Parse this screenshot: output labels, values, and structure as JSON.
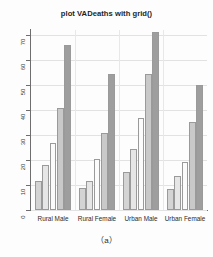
{
  "figure": {
    "title": "plot VADeaths with grid()",
    "caption": "（a）"
  },
  "axes": {
    "y_ticks": [
      "0",
      "10",
      "20",
      "30",
      "40",
      "50",
      "60",
      "70"
    ],
    "x_group_labels": [
      "Rural Male",
      "Rural Female",
      "Urban Male",
      "Urban Female"
    ]
  },
  "palette": {
    "bar_1": "#d4d4d4",
    "bar_2": "#e6e6e6",
    "bar_3": "#fbfbfb",
    "bar_4": "#c9c9c9",
    "bar_5": "#9e9e9e",
    "bar_border": "#9a9a9a",
    "grid": "#e2e2e2",
    "axis": "#6e6e6e",
    "text": "#2b2b2b",
    "background": "#fdfdfd"
  },
  "chart_data": {
    "type": "bar",
    "title": "plot VADeaths with grid()",
    "xlabel": "",
    "ylabel": "",
    "ylim": [
      0,
      72
    ],
    "yticks": [
      0,
      10,
      20,
      30,
      40,
      50,
      60,
      70
    ],
    "grid": true,
    "legend": "none",
    "grouping": "grouped",
    "categories": [
      "Rural Male",
      "Rural Female",
      "Urban Male",
      "Urban Female"
    ],
    "series": [
      {
        "name": "50-54",
        "values": [
          11.7,
          8.7,
          15.4,
          8.4
        ],
        "color": "#d4d4d4"
      },
      {
        "name": "55-59",
        "values": [
          18.1,
          11.7,
          24.3,
          13.6
        ],
        "color": "#e6e6e6"
      },
      {
        "name": "60-64",
        "values": [
          26.9,
          20.3,
          37.0,
          19.3
        ],
        "color": "#fbfbfb"
      },
      {
        "name": "65-69",
        "values": [
          41.0,
          30.9,
          54.6,
          35.1
        ],
        "color": "#c9c9c9"
      },
      {
        "name": "70-74",
        "values": [
          66.0,
          54.3,
          71.1,
          50.0
        ],
        "color": "#9e9e9e"
      }
    ]
  }
}
